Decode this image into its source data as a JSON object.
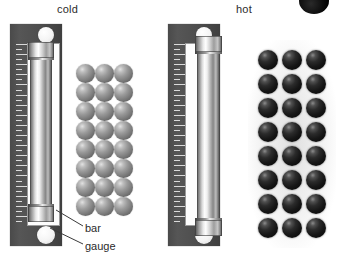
{
  "figure": {
    "title_left": "cold",
    "title_right": "hot",
    "labels": {
      "bar": "bar",
      "gauge": "gauge"
    },
    "colors": {
      "plate": "#4e4e4e",
      "window": "#fdfdfd",
      "bar_metal": "#c9c9c9",
      "molecule_cold": "#8a8a8a",
      "molecule_hot": "#141414",
      "text": "#2b2b2b",
      "background": "#ffffff"
    }
  },
  "panels": [
    {
      "id": "cold",
      "caption": "cold",
      "state": "cold",
      "gauge": {
        "x": 10,
        "y": 24,
        "width": 52,
        "height": 222,
        "window": {
          "x": 17,
          "y": 19,
          "width": 33,
          "height": 183
        },
        "holes": [
          {
            "cx": 36,
            "cy": 11,
            "r": 8
          },
          {
            "cx": 36,
            "cy": 211,
            "r": 9
          }
        ],
        "ruler": {
          "x": 6,
          "y": 20,
          "width": 12,
          "height": 182,
          "tick_count": 37
        }
      },
      "bar": {
        "x": 30,
        "y": 42,
        "width": 22,
        "height": 180,
        "fits_in_gauge": true
      },
      "molecules": {
        "x": 76,
        "y": 64,
        "columns": 3,
        "rows": 8,
        "diameter": 19,
        "gap_x": 0,
        "gap_y": 0,
        "shade": "cold",
        "spacing_note": "tightly packed"
      }
    },
    {
      "id": "hot",
      "caption": "hot",
      "state": "hot",
      "gauge": {
        "x": 168,
        "y": 24,
        "width": 52,
        "height": 222,
        "window": {
          "x": 17,
          "y": 19,
          "width": 33,
          "height": 183
        },
        "holes": [
          {
            "cx": 36,
            "cy": 11,
            "r": 8
          },
          {
            "cx": 36,
            "cy": 211,
            "r": 9
          }
        ],
        "ruler": {
          "x": 6,
          "y": 20,
          "width": 12,
          "height": 182,
          "tick_count": 37
        }
      },
      "bar": {
        "x": 197,
        "y": 36,
        "width": 23,
        "height": 200,
        "fits_in_gauge": false
      },
      "molecules": {
        "x": 258,
        "y": 50,
        "columns": 3,
        "rows": 8,
        "diameter": 20,
        "gap_x": 4,
        "gap_y": 4,
        "shade": "hot",
        "spacing_note": "spread apart"
      }
    }
  ],
  "callouts": [
    {
      "name": "bar",
      "label": "bar",
      "label_x": 85,
      "label_y": 222,
      "line": {
        "x1": 83,
        "y1": 226,
        "x2": 56,
        "y2": 210
      }
    },
    {
      "name": "gauge",
      "label": "gauge",
      "label_x": 85,
      "label_y": 240,
      "line": {
        "x1": 83,
        "y1": 244,
        "x2": 50,
        "y2": 228
      }
    }
  ]
}
